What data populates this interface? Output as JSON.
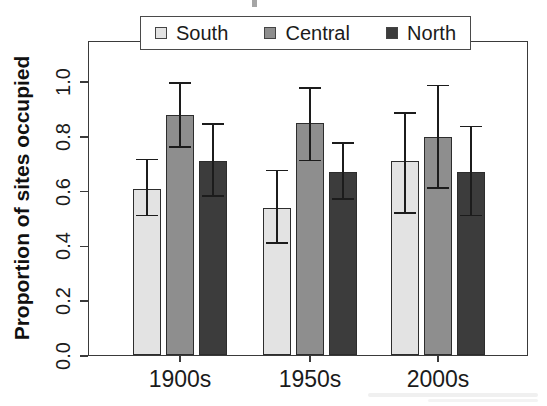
{
  "figure": {
    "y_axis_title": "Proportion of sites occupied"
  },
  "chart_data": {
    "type": "bar",
    "title": "",
    "xlabel": "",
    "ylabel": "Proportion of sites occupied",
    "categories": [
      "1900s",
      "1950s",
      "2000s"
    ],
    "y_tick_labels": [
      "0.0",
      "0.2",
      "0.4",
      "0.6",
      "0.8",
      "1.0"
    ],
    "ylim": [
      0,
      1.15
    ],
    "grid": false,
    "error_bars": true,
    "legend_position": "top-inside",
    "series": [
      {
        "name": "South",
        "color": "#e3e3e3",
        "values": [
          0.61,
          0.54,
          0.71
        ],
        "error_low": [
          0.51,
          0.41,
          0.52
        ],
        "error_high": [
          0.72,
          0.68,
          0.89
        ]
      },
      {
        "name": "Central",
        "color": "#8e8e8e",
        "values": [
          0.88,
          0.85,
          0.8
        ],
        "error_low": [
          0.76,
          0.71,
          0.61
        ],
        "error_high": [
          1.0,
          0.98,
          0.99
        ]
      },
      {
        "name": "North",
        "color": "#3c3c3c",
        "values": [
          0.71,
          0.67,
          0.67
        ],
        "error_low": [
          0.58,
          0.57,
          0.51
        ],
        "error_high": [
          0.85,
          0.78,
          0.84
        ]
      }
    ]
  }
}
